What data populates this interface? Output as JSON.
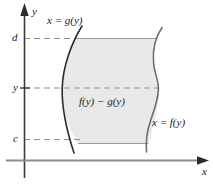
{
  "figure": {
    "background_color": "#ffffff"
  },
  "axes": {
    "y_axis": {
      "label": "y",
      "color": "#3a3a3a",
      "arrow": "up-arrow-icon"
    },
    "x_axis": {
      "label": "x",
      "color": "#8c8c8c",
      "arrow": "right-arrow-icon"
    }
  },
  "ticks": [
    {
      "label": "d",
      "name": "tick-d",
      "value_y": 38
    },
    {
      "label": "y",
      "name": "tick-y",
      "value_y": 88
    },
    {
      "label": "c",
      "name": "tick-c",
      "value_y": 139
    }
  ],
  "curves": [
    {
      "name": "curve-g",
      "label": "x = g(y)",
      "side": "left",
      "color": "#2b2b2b"
    },
    {
      "name": "curve-f",
      "label": "x = f(y)",
      "side": "right",
      "color": "#6e6e6e"
    }
  ],
  "region": {
    "label": "f(y) − g(y)",
    "fill_color": "#e9e9e9",
    "edge_color": "#9a9a9a",
    "top_boundary": "d",
    "bottom_boundary": "c"
  },
  "dashed_lines": {
    "color": "#8f8f8f",
    "levels": [
      "d",
      "y",
      "c"
    ]
  }
}
